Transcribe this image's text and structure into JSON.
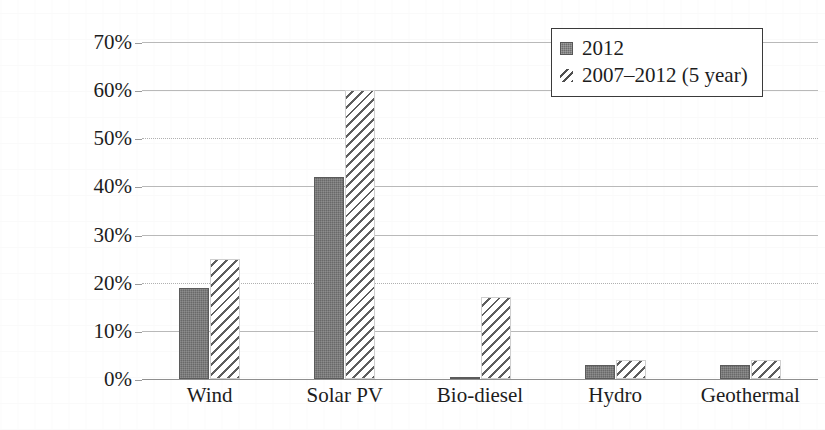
{
  "chart_data": {
    "type": "bar",
    "title": "",
    "xlabel": "",
    "ylabel": "Growth rate of installed capacity",
    "categories": [
      "Wind",
      "Solar PV",
      "Bio-diesel",
      "Hydro",
      "Geothermal"
    ],
    "series": [
      {
        "name": "2012",
        "style": "solid",
        "values": [
          19,
          42,
          0.5,
          3,
          3
        ]
      },
      {
        "name": "2007–2012 (5 year)",
        "style": "hatched",
        "values": [
          25,
          60,
          17,
          4,
          4
        ]
      }
    ],
    "ylim": [
      0,
      70
    ],
    "ytick_values": [
      0,
      10,
      20,
      30,
      40,
      50,
      60,
      70
    ],
    "ytick_labels": [
      "0%",
      "10%",
      "20%",
      "30%",
      "40%",
      "50%",
      "60%",
      "70%"
    ],
    "value_unit": "%",
    "grid": "horizontal",
    "grid_styles": {
      "0": "solid",
      "10": "solid",
      "20": "dotted",
      "30": "solid",
      "40": "solid",
      "50": "dotted",
      "60": "solid",
      "70": "solid"
    },
    "legend_position": "top-right",
    "legend_entries": [
      "2012",
      "2007–2012 (5 year)"
    ],
    "colors": {
      "series_2012": "#696969",
      "series_5year_hatch": "#5e5e5e",
      "gridline": "#b9b9b9",
      "axis": "#8f8f8f",
      "text": "#1d1d1d"
    }
  }
}
